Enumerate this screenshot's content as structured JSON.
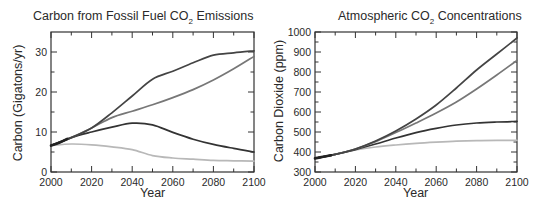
{
  "chart_data": [
    {
      "type": "line",
      "title": "Carbon from Fossil Fuel CO2 Emissions",
      "title_main": "Carbon from Fossil Fuel CO",
      "title_sub": "2",
      "title_tail": " Emissions",
      "xlabel": "Year",
      "ylabel": "Carbon (Gigatons/yr)",
      "xlim": [
        2000,
        2100
      ],
      "ylim": [
        0,
        35
      ],
      "xticks": [
        2000,
        2020,
        2040,
        2060,
        2080,
        2100
      ],
      "yticks": [
        0,
        10,
        20,
        30
      ],
      "grid": false,
      "legend": "none",
      "x": [
        2000,
        2010,
        2020,
        2030,
        2040,
        2050,
        2060,
        2070,
        2080,
        2090,
        2100
      ],
      "series": [
        {
          "name": "historical",
          "color": "#222222",
          "x": [
            2000,
            2004,
            2008
          ],
          "values": [
            6.6,
            7.3,
            8.3
          ]
        },
        {
          "name": "high (dark)",
          "color": "#444444",
          "values": [
            6.6,
            8.6,
            11.0,
            14.8,
            19.0,
            23.2,
            25.2,
            27.3,
            29.2,
            29.8,
            30.3
          ]
        },
        {
          "name": "medium-high (grey)",
          "color": "#777777",
          "values": [
            6.6,
            8.6,
            11.0,
            13.6,
            15.2,
            16.8,
            18.6,
            20.6,
            23.0,
            25.8,
            28.9
          ]
        },
        {
          "name": "medium (dark)",
          "color": "#333333",
          "values": [
            6.6,
            8.6,
            10.0,
            11.2,
            12.2,
            11.8,
            9.9,
            8.2,
            6.9,
            5.9,
            5.0
          ]
        },
        {
          "name": "low (light grey)",
          "color": "#b8b8b8",
          "values": [
            6.6,
            7.0,
            6.8,
            6.3,
            5.6,
            4.1,
            3.5,
            3.2,
            2.9,
            2.8,
            2.7
          ]
        }
      ]
    },
    {
      "type": "line",
      "title": "Atmospheric CO2 Concentrations",
      "title_main": "Atmospheric CO",
      "title_sub": "2",
      "title_tail": " Concentrations",
      "xlabel": "Year",
      "ylabel": "Carbon Dioxide (ppm)",
      "xlim": [
        2000,
        2100
      ],
      "ylim": [
        300,
        1000
      ],
      "xticks": [
        2000,
        2020,
        2040,
        2060,
        2080,
        2100
      ],
      "yticks": [
        300,
        400,
        500,
        600,
        700,
        800,
        900,
        1000
      ],
      "grid": false,
      "legend": "none",
      "x": [
        2000,
        2010,
        2020,
        2030,
        2040,
        2050,
        2060,
        2070,
        2080,
        2090,
        2100
      ],
      "series": [
        {
          "name": "historical",
          "color": "#222222",
          "x": [
            2000,
            2004,
            2008
          ],
          "values": [
            368,
            376,
            384
          ]
        },
        {
          "name": "high (dark)",
          "color": "#444444",
          "values": [
            368,
            388,
            415,
            455,
            505,
            565,
            635,
            720,
            810,
            890,
            970
          ]
        },
        {
          "name": "medium-high (grey)",
          "color": "#777777",
          "values": [
            368,
            388,
            415,
            452,
            497,
            545,
            595,
            650,
            715,
            785,
            858
          ]
        },
        {
          "name": "medium (dark)",
          "color": "#333333",
          "values": [
            368,
            388,
            412,
            440,
            470,
            497,
            518,
            535,
            545,
            550,
            553
          ]
        },
        {
          "name": "low (light grey)",
          "color": "#b8b8b8",
          "values": [
            368,
            388,
            410,
            425,
            435,
            443,
            449,
            454,
            457,
            458,
            458
          ]
        }
      ]
    }
  ]
}
